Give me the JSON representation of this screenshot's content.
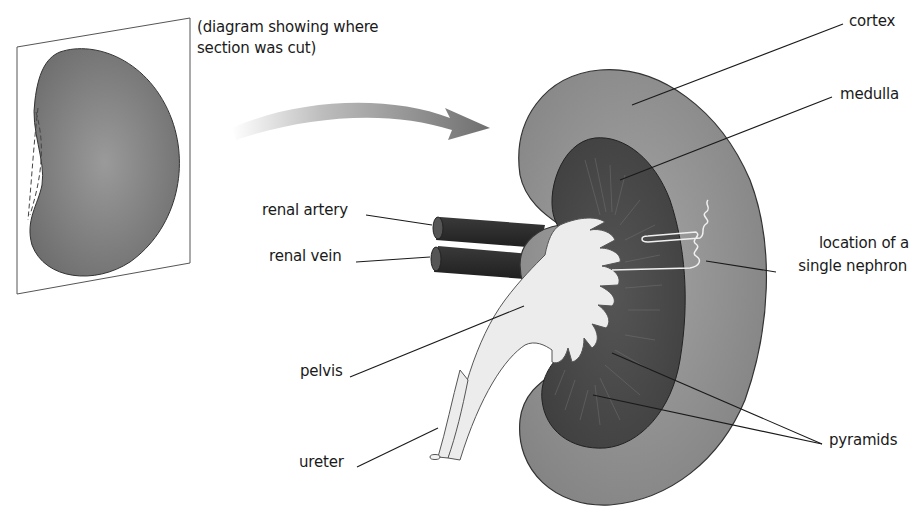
{
  "caption": {
    "line1": "(diagram showing where",
    "line2": "section was cut)"
  },
  "labels": {
    "cortex": "cortex",
    "medulla": "medulla",
    "renal_artery": "renal artery",
    "renal_vein": "renal vein",
    "nephron_line1": "location of a",
    "nephron_line2": "single nephron",
    "pelvis": "pelvis",
    "ureter": "ureter",
    "pyramids": "pyramids"
  },
  "colors": {
    "cortex": "#8a8a8a",
    "cortex_light": "#a8a8a8",
    "medulla": "#4a4a4a",
    "pelvis": "#ececec",
    "vessel": "#2a2a2a",
    "small_kidney": "#7a7a7a",
    "outline": "#333333",
    "leader_line": "#1a1a1a"
  }
}
